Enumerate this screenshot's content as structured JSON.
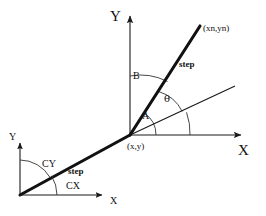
{
  "diagram": {
    "background_color": "#ffffff",
    "stroke_color": "#1a1a1a",
    "arc_color": "#333333",
    "main_frame": {
      "origin_label": "(x,y)",
      "y_axis_label": "Y",
      "x_axis_label": "X",
      "endpoint_label": "(xn,yn)",
      "step_label": "step",
      "angle_a_label": "A",
      "angle_b_label": "B",
      "angle_theta_label": "θ"
    },
    "secondary_frame": {
      "y_axis_label": "Y",
      "x_axis_label": "X",
      "step_label": "step",
      "angle_cy_label": "CY",
      "angle_cx_label": "CX"
    }
  }
}
